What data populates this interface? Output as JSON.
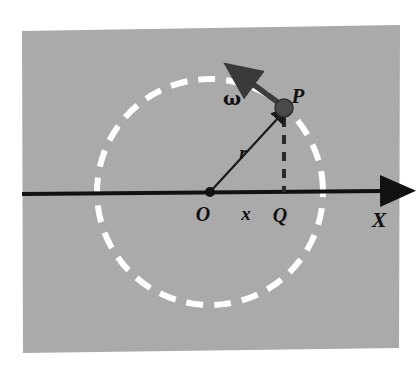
{
  "figure": {
    "background_color": "#ffffff",
    "panel_color": "#a9a9a9",
    "ink_color": "#111111",
    "circle_color": "#ffffff",
    "vector_color": "#333333"
  },
  "labels": {
    "origin": "O",
    "point_p": "P",
    "foot_q": "Q",
    "radius": "r",
    "displacement": "x",
    "angular_velocity": "ω",
    "axis_x": "X"
  },
  "geometry": {
    "panel": {
      "x": 22,
      "y": 28,
      "width": 378,
      "height": 324
    },
    "circle": {
      "center_x": 210,
      "center_y": 192,
      "radius": 113,
      "dash": "17 11",
      "stroke_width": 6
    },
    "axis": {
      "y": 192,
      "x_start": 22,
      "x_end": 392,
      "stroke_width": 4
    },
    "origin_point": {
      "x": 210,
      "y": 192,
      "dot_radius": 5
    },
    "point_p": {
      "x": 284,
      "y": 108,
      "dot_radius": 9
    },
    "point_q": {
      "x": 284,
      "y": 192
    },
    "radius_arrow": {
      "x1": 210,
      "y1": 192,
      "x2": 279,
      "y2": 116
    },
    "omega_arrow": {
      "x1": 281,
      "y1": 105,
      "x2": 243,
      "y2": 77
    },
    "pq_dashed": {
      "x": 284,
      "y_top": 118,
      "y_bottom": 192,
      "dash": "9 8"
    }
  },
  "label_positions": {
    "origin": {
      "x": 203,
      "y": 220
    },
    "point_p": {
      "x": 297,
      "y": 102
    },
    "foot_q": {
      "x": 279,
      "y": 221
    },
    "radius": {
      "x": 242,
      "y": 158
    },
    "displacement": {
      "x": 246,
      "y": 220
    },
    "angular_velocity": {
      "x": 231,
      "y": 103
    },
    "axis_x": {
      "x": 378,
      "y": 226
    }
  }
}
